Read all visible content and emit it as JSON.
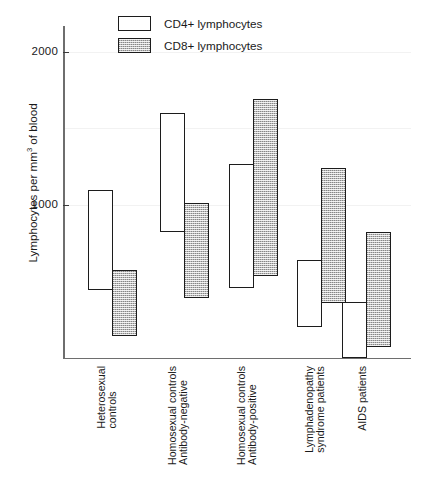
{
  "chart_data": {
    "type": "bar",
    "subtype": "floating-range-bar",
    "title": "",
    "xlabel": "",
    "ylabel": "Lymphocytes per mm³ of blood",
    "ylabel_parts": {
      "pre": "Lymphocytes per mm",
      "sup": "3",
      "post": " of blood"
    },
    "ylim": [
      0,
      2250
    ],
    "yticks": [
      1000,
      2000
    ],
    "ytick_labels": [
      "1000",
      "2000"
    ],
    "grid": "faint-horizontal",
    "legend_position": "top-center",
    "categories": [
      "Heterosexual\ncontrols",
      "Homosexual controls\nAntibody-negative",
      "Homosexual controls\nAntibody-positive",
      "Lymphadenopathy\nsyndrome patients",
      "AIDS patients"
    ],
    "series": [
      {
        "name": "CD4+ lymphocytes",
        "fill": "white",
        "low": [
          445,
          825,
          458,
          203,
          0
        ],
        "high": [
          1100,
          1600,
          1270,
          640,
          366
        ]
      },
      {
        "name": "CD8+ lymphocytes",
        "fill": "grey-hatched",
        "low": [
          145,
          390,
          536,
          360,
          72
        ],
        "high": [
          575,
          1015,
          1690,
          1240,
          825
        ]
      }
    ]
  },
  "legend": {
    "items": [
      {
        "label": "CD4+ lymphocytes",
        "swatch": "cd4"
      },
      {
        "label": "CD8+ lymphocytes",
        "swatch": "cd8"
      }
    ]
  },
  "axis": {
    "y_title_pre": "Lymphocytes per mm",
    "y_title_sup": "3",
    "y_title_post": " of blood",
    "tick_2000": "2000",
    "tick_1000": "1000"
  },
  "colors": {
    "bar_outline": "#1c1c1c",
    "cd4_fill": "#ffffff",
    "cd8_fill": "#bdbdbd",
    "axis": "#6e6e6e",
    "text": "#1a1a1a",
    "gridline": "#f2f2f2",
    "background": "#ffffff"
  }
}
